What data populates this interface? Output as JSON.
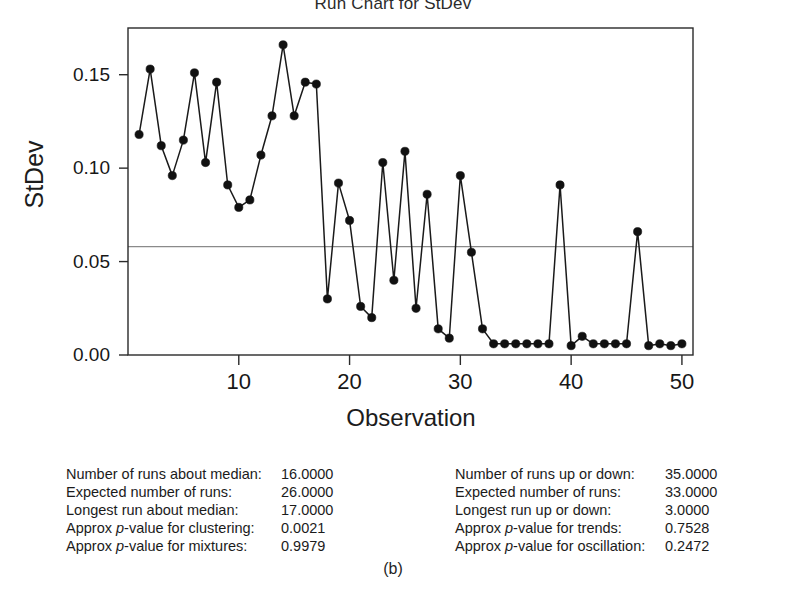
{
  "figure": {
    "title": "Run Chart for StDev",
    "caption": "(b)"
  },
  "chart_data": {
    "type": "line",
    "title": "Run Chart for StDev",
    "xlabel": "Observation",
    "ylabel": "StDev",
    "xlim": [
      0,
      51
    ],
    "ylim": [
      0.0,
      0.175
    ],
    "grid": false,
    "legend": "none",
    "markers": "filled-circle",
    "reference_lines": [
      {
        "name": "median",
        "value": 0.058,
        "orientation": "horizontal"
      }
    ],
    "x_ticks": [
      10,
      20,
      30,
      40,
      50
    ],
    "x_tick_labels": [
      "10",
      "20",
      "30",
      "40",
      "50"
    ],
    "y_ticks": [
      0.0,
      0.05,
      0.1,
      0.15
    ],
    "y_tick_labels": [
      "0.00",
      "0.05",
      "0.10",
      "0.15"
    ],
    "x": [
      1,
      2,
      3,
      4,
      5,
      6,
      7,
      8,
      9,
      10,
      11,
      12,
      13,
      14,
      15,
      16,
      17,
      18,
      19,
      20,
      21,
      22,
      23,
      24,
      25,
      26,
      27,
      28,
      29,
      30,
      31,
      32,
      33,
      34,
      35,
      36,
      37,
      38,
      39,
      40,
      41,
      42,
      43,
      44,
      45,
      46,
      47,
      48,
      49,
      50
    ],
    "values": [
      0.118,
      0.153,
      0.112,
      0.096,
      0.115,
      0.151,
      0.103,
      0.146,
      0.091,
      0.079,
      0.083,
      0.107,
      0.128,
      0.166,
      0.128,
      0.146,
      0.145,
      0.03,
      0.092,
      0.072,
      0.026,
      0.02,
      0.103,
      0.04,
      0.109,
      0.025,
      0.086,
      0.014,
      0.009,
      0.096,
      0.055,
      0.014,
      0.006,
      0.006,
      0.006,
      0.006,
      0.006,
      0.006,
      0.091,
      0.005,
      0.01,
      0.006,
      0.006,
      0.006,
      0.006,
      0.066,
      0.005,
      0.006,
      0.005,
      0.006
    ]
  },
  "axes": {
    "y_title": "StDev",
    "x_title": "Observation",
    "y_tick_labels": [
      "0.15",
      "0.10",
      "0.05",
      "0.00"
    ],
    "x_tick_labels": [
      "10",
      "20",
      "30",
      "40",
      "50"
    ]
  },
  "stats": {
    "left": [
      {
        "label_pre": "Number of runs about median:",
        "label_mid": "",
        "label_post": "",
        "value": "16.0000"
      },
      {
        "label_pre": "Expected number of runs:",
        "label_mid": "",
        "label_post": "",
        "value": "26.0000"
      },
      {
        "label_pre": "Longest run about median:",
        "label_mid": "",
        "label_post": "",
        "value": "17.0000"
      },
      {
        "label_pre": "Approx ",
        "label_mid": "p",
        "label_post": "-value for clustering:",
        "value": "0.0021"
      },
      {
        "label_pre": "Approx ",
        "label_mid": "p",
        "label_post": "-value for mixtures:",
        "value": "0.9979"
      }
    ],
    "right": [
      {
        "label_pre": "Number of runs up or down:",
        "label_mid": "",
        "label_post": "",
        "value": "35.0000"
      },
      {
        "label_pre": "Expected number of runs:",
        "label_mid": "",
        "label_post": "",
        "value": "33.0000"
      },
      {
        "label_pre": "Longest run up or down:",
        "label_mid": "",
        "label_post": "",
        "value": "3.0000"
      },
      {
        "label_pre": "Approx ",
        "label_mid": "p",
        "label_post": "-value for trends:",
        "value": "0.7528"
      },
      {
        "label_pre": "Approx ",
        "label_mid": "p",
        "label_post": "-value for oscillation:",
        "value": "0.2472"
      }
    ]
  },
  "colors": {
    "line": "#1a1a1a",
    "marker": "#111111",
    "median_line": "#8a8a8a",
    "axis": "#2a2a2a",
    "text": "#1a1a1a",
    "background": "#ffffff"
  }
}
